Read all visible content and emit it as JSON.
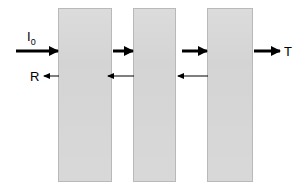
{
  "figure": {
    "background_color": "#ffffff",
    "width": 302,
    "height": 189
  },
  "style": {
    "slab_fill": "#d2d2d2",
    "slab_border": "#b9b9b9",
    "arrow_color": "#000000"
  },
  "labels": {
    "incident": "I",
    "incident_sub": "0",
    "reflected": "R",
    "transmitted": "T"
  },
  "slabs": [
    {
      "id": "slab-1",
      "x": 58,
      "y": 8,
      "width": 54,
      "height": 174
    },
    {
      "id": "slab-2",
      "x": 133,
      "y": 8,
      "width": 43,
      "height": 174
    },
    {
      "id": "slab-3",
      "x": 207,
      "y": 8,
      "width": 46,
      "height": 174
    }
  ],
  "arrows": {
    "forward": [
      {
        "id": "arrow-incident",
        "x": 16,
        "y": 51,
        "length": 42,
        "weight": "thick",
        "direction": "right"
      },
      {
        "id": "arrow-transmit-1",
        "x": 113,
        "y": 51,
        "length": 20,
        "weight": "thick",
        "direction": "right"
      },
      {
        "id": "arrow-transmit-2",
        "x": 182,
        "y": 51,
        "length": 25,
        "weight": "thick",
        "direction": "right"
      },
      {
        "id": "arrow-transmitted-out",
        "x": 254,
        "y": 51,
        "length": 26,
        "weight": "thick",
        "direction": "right"
      }
    ],
    "backward": [
      {
        "id": "arrow-reflected-out",
        "x": 44,
        "y": 76,
        "length": 15,
        "weight": "thin",
        "direction": "left"
      },
      {
        "id": "arrow-reflect-1",
        "x": 108,
        "y": 76,
        "length": 26,
        "weight": "thin",
        "direction": "left"
      },
      {
        "id": "arrow-reflect-2",
        "x": 178,
        "y": 76,
        "length": 30,
        "weight": "thin",
        "direction": "left"
      }
    ]
  },
  "label_positions": {
    "incident": {
      "x": 27,
      "y": 30
    },
    "reflected": {
      "x": 30,
      "y": 70
    },
    "transmitted": {
      "x": 284,
      "y": 45
    }
  }
}
